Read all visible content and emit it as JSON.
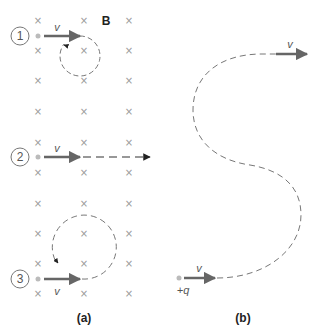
{
  "panel_a": {
    "caption": "(a)",
    "field_label": "B",
    "cross_symbol": "×",
    "cross_columns_x": [
      38,
      84,
      129
    ],
    "cross_rows_y": [
      20,
      50,
      80,
      111,
      142,
      172,
      203,
      233,
      263,
      293
    ],
    "cases": [
      {
        "number": "1",
        "velocity_label": "v",
        "path": "circle-small",
        "y": 36
      },
      {
        "number": "2",
        "velocity_label": "v",
        "path": "straight",
        "y": 157
      },
      {
        "number": "3",
        "velocity_label": "v",
        "path": "circle-large",
        "y": 279
      }
    ]
  },
  "panel_b": {
    "caption": "(b)",
    "charge_label": "+q",
    "start_velocity_label": "v",
    "end_velocity_label": "v",
    "path": "s-curve"
  },
  "colors": {
    "cross": "#9a9a9a",
    "arrow": "#666666",
    "dashed_path": "#777777",
    "particle": "#bbbbbb",
    "text": "#555555"
  }
}
